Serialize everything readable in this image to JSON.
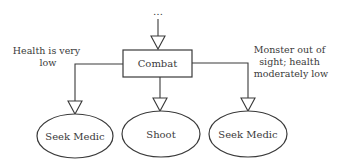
{
  "diagram": {
    "entry_marker": "…",
    "root": {
      "label": "Combat",
      "shape": "rectangle"
    },
    "children": [
      {
        "label": "Seek Medic",
        "shape": "ellipse",
        "condition": [
          "Health is very",
          "low"
        ]
      },
      {
        "label": "Shoot",
        "shape": "ellipse",
        "condition": []
      },
      {
        "label": "Seek Medic",
        "shape": "ellipse",
        "condition": [
          "Monster out of",
          "sight; health",
          "moderately low"
        ]
      }
    ],
    "colors": {
      "stroke": "#3a3a3a",
      "fill": "#ffffff",
      "text": "#3a3a3a"
    }
  }
}
